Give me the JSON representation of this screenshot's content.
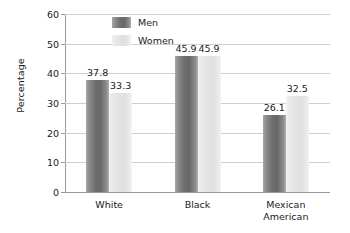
{
  "chart_data": {
    "type": "bar",
    "title": "",
    "xlabel": "",
    "ylabel": "Percentage",
    "ylim": [
      0,
      60
    ],
    "yticks": [
      0,
      10,
      20,
      30,
      40,
      50,
      60
    ],
    "ytick_labels": [
      "0",
      "10",
      "20",
      "30",
      "40",
      "50",
      "60"
    ],
    "grid": true,
    "legend_position": "upper-left-inside",
    "categories": [
      "White",
      "Black",
      "Mexican American"
    ],
    "category_lines": [
      [
        "White"
      ],
      [
        "Black"
      ],
      [
        "Mexican",
        "American"
      ]
    ],
    "series": [
      {
        "name": "Men",
        "color": "#6d6d6d",
        "values": [
          37.8,
          45.9,
          26.1
        ],
        "labels": [
          "37.8",
          "45.9",
          "26.1"
        ]
      },
      {
        "name": "Women",
        "color": "#e2e2e2",
        "values": [
          33.3,
          45.9,
          32.5
        ],
        "labels": [
          "33.3",
          "45.9",
          "32.5"
        ]
      }
    ]
  },
  "axis": {
    "line_color": "#9a9a9a",
    "grid_color": "#cfcfcf"
  }
}
